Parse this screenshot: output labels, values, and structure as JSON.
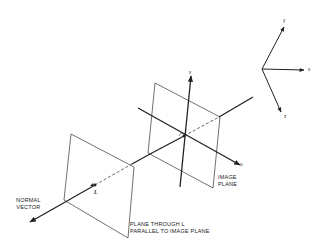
{
  "diagram": {
    "colors": {
      "line": "#222222",
      "background": "#ffffff"
    },
    "world_axes": {
      "x_label": "x",
      "y_label": "y",
      "z_label": "z"
    },
    "camera_axes": {
      "u_label": "u",
      "v_label": "v"
    },
    "labels": {
      "image_plane_line1": "IMAGE",
      "image_plane_line2": "PLANE",
      "normal_vector_line1": "NORMAL",
      "normal_vector_line2": "VECTOR",
      "plane_through_line1": "PLANE THROUGH L",
      "plane_through_line2": "PARALLEL TO IMAGE PLANE",
      "point_L": "L"
    }
  }
}
